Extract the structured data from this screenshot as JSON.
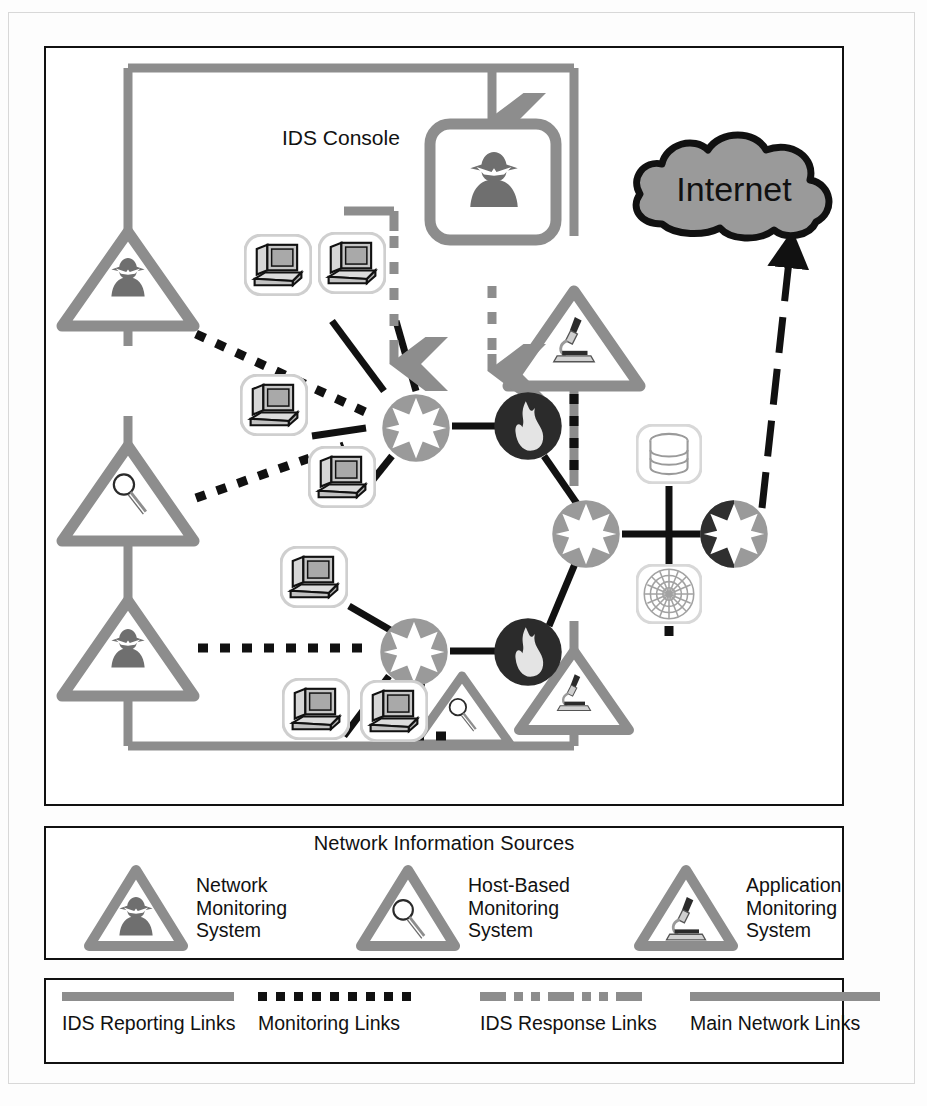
{
  "diagram": {
    "title_label": "IDS Console",
    "internet_label": "Internet"
  },
  "colors": {
    "ids_reporting_link": "#8d8d8d",
    "monitoring_link": "#111111",
    "ids_response_link": "#8d8d8d",
    "main_network_link": "#111111",
    "router_fill": "#9a9a9a",
    "firewall_fill": "#2b2b2b",
    "triangle_stroke": "#8d8d8d",
    "cloud_fill": "#9a9a9a",
    "panel_border": "#111111",
    "workstation_fill": "#b9b9b9"
  },
  "sources_legend": {
    "title": "Network Information Sources",
    "items": [
      {
        "icon": "spy-icon",
        "label": "Network\nMonitoring\nSystem"
      },
      {
        "icon": "magnifier-icon",
        "label": "Host-Based\nMonitoring\nSystem"
      },
      {
        "icon": "microscope-icon",
        "label": "Application\nMonitoring\nSystem"
      }
    ]
  },
  "links_legend": {
    "items": [
      {
        "style": "solid-gray",
        "label": "IDS Reporting Links"
      },
      {
        "style": "dotted-black",
        "label": "Monitoring Links"
      },
      {
        "style": "dashdot-gray",
        "label": "IDS Response Links"
      },
      {
        "style": "solid-gray",
        "label": "Main Network Links"
      }
    ]
  },
  "nodes": {
    "ids_console": {
      "name": "IDS Console",
      "icon": "spy-icon"
    },
    "internet_cloud": {
      "name": "Internet",
      "icon": "cloud-icon"
    },
    "routers": [
      {
        "id": "router-left-top",
        "icon": "router-icon"
      },
      {
        "id": "router-center",
        "icon": "router-icon"
      },
      {
        "id": "router-left-bottom",
        "icon": "router-icon"
      },
      {
        "id": "router-edge",
        "icon": "router-icon"
      }
    ],
    "firewalls": [
      {
        "id": "firewall-top",
        "icon": "firewall-icon"
      },
      {
        "id": "firewall-bottom",
        "icon": "firewall-icon"
      }
    ],
    "workstations": [
      {
        "id": "ws-1",
        "icon": "workstation-icon"
      },
      {
        "id": "ws-2",
        "icon": "workstation-icon"
      },
      {
        "id": "ws-3",
        "icon": "workstation-icon"
      },
      {
        "id": "ws-4",
        "icon": "workstation-icon"
      },
      {
        "id": "ws-5",
        "icon": "workstation-icon"
      },
      {
        "id": "ws-6",
        "icon": "workstation-icon"
      },
      {
        "id": "ws-7",
        "icon": "workstation-icon"
      }
    ],
    "servers": [
      {
        "id": "database-server",
        "icon": "database-icon"
      },
      {
        "id": "web-server",
        "icon": "globe-icon"
      }
    ],
    "monitors": [
      {
        "id": "net-monitor-top-left",
        "icon": "spy-icon",
        "type": "Network Monitoring System"
      },
      {
        "id": "host-monitor-mid-left",
        "icon": "magnifier-icon",
        "type": "Host-Based Monitoring System"
      },
      {
        "id": "net-monitor-bottom-left",
        "icon": "spy-icon",
        "type": "Network Monitoring System"
      },
      {
        "id": "host-monitor-bottom",
        "icon": "magnifier-icon",
        "type": "Host-Based Monitoring System"
      },
      {
        "id": "app-monitor-top",
        "icon": "microscope-icon",
        "type": "Application Monitoring System"
      },
      {
        "id": "app-monitor-bottom",
        "icon": "microscope-icon",
        "type": "Application Monitoring System"
      }
    ]
  }
}
